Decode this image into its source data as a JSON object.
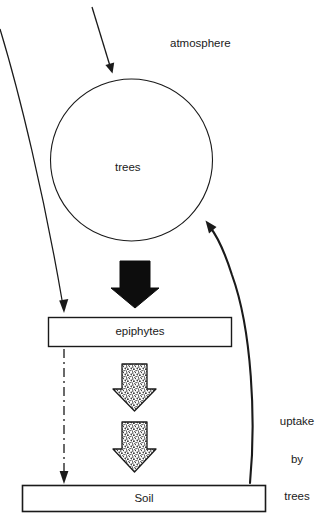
{
  "diagram": {
    "background_color": "#ffffff",
    "line_color": "#1a1a1a",
    "labels": {
      "atmosphere": "atmosphere",
      "trees": "trees",
      "epiphytes": "epiphytes",
      "soil": "Soil",
      "uptake_line1": "uptake",
      "uptake_line2": "by",
      "uptake_line3": "trees"
    },
    "nodes": [
      {
        "id": "trees",
        "shape": "circle",
        "label": "trees",
        "cx": 131.5,
        "cy": 160,
        "r": 81,
        "fill": "#ffffff",
        "stroke": "#1a1a1a"
      },
      {
        "id": "epiphytes",
        "shape": "rectangle",
        "label": "epiphytes",
        "x": 48,
        "y": 317,
        "width": 184,
        "height": 30,
        "fill": "#ffffff",
        "stroke": "#1a1a1a"
      },
      {
        "id": "soil",
        "shape": "rectangle",
        "label": "Soil",
        "x": 22,
        "y": 485,
        "width": 244,
        "height": 27,
        "fill": "#ffffff",
        "stroke": "#1a1a1a"
      }
    ],
    "arrows": [
      {
        "id": "atmosphere-to-trees",
        "style": "thin-straight",
        "from": "atmosphere",
        "to": "trees",
        "label": ""
      },
      {
        "id": "atmosphere-to-epiphytes",
        "style": "thin-curved",
        "from": "atmosphere",
        "to": "epiphytes",
        "label": ""
      },
      {
        "id": "trees-to-epiphytes",
        "style": "solid-block",
        "from": "trees",
        "to": "epiphytes",
        "label": ""
      },
      {
        "id": "epiphytes-to-soil-dashed",
        "style": "dash-dot",
        "from": "epiphytes",
        "to": "soil",
        "label": ""
      },
      {
        "id": "epiphytes-to-soil-stippled-upper",
        "style": "stippled-block",
        "from": "epiphytes",
        "to": "soil",
        "label": ""
      },
      {
        "id": "epiphytes-to-soil-stippled-lower",
        "style": "stippled-block",
        "from": "epiphytes",
        "to": "soil",
        "label": ""
      },
      {
        "id": "soil-to-trees",
        "style": "thick-curved",
        "from": "soil",
        "to": "trees",
        "label": "uptake by trees"
      }
    ]
  }
}
